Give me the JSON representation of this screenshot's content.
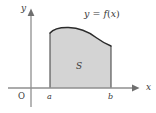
{
  "figure": {
    "background_color": "#ffffff",
    "axes": {
      "x_axis": {
        "label": "x",
        "label_x": 146,
        "label_y": 90,
        "y_position": 88,
        "x_start": 8,
        "x_end": 138,
        "color": "#8a8a8a",
        "arrow": "right"
      },
      "y_axis": {
        "label": "y",
        "label_x": 21,
        "label_y": 11,
        "x_position": 31,
        "y_start": 107,
        "y_end": 9,
        "color": "#8a8a8a",
        "arrow": "up"
      },
      "origin_label": "O",
      "origin_label_x": 18,
      "origin_label_y": 99
    },
    "ticks": [
      {
        "name": "a",
        "label": "a",
        "x": 50,
        "label_x": 47,
        "label_y": 99
      },
      {
        "name": "b",
        "label": "b",
        "x": 111,
        "label_x": 108,
        "label_y": 99
      }
    ],
    "region": {
      "label": "S",
      "label_x": 76,
      "label_y": 69,
      "fill_color": "#d4d4d4",
      "outline_color": "#3f3f3f"
    },
    "curve": {
      "label_y": "y",
      "label_equals": " = ",
      "label_f": "f",
      "label_paren_open": "(",
      "label_var": "x",
      "label_paren_close": ")",
      "label_full": "y = f(x)",
      "label_x": 84,
      "label_y_pos": 17,
      "color": "#2b2b2b",
      "left_x": 50,
      "left_top_y": 33,
      "right_x": 111,
      "right_top_y": 46,
      "peak_x": 79,
      "peak_y": 28,
      "baseline_y": 88
    }
  }
}
